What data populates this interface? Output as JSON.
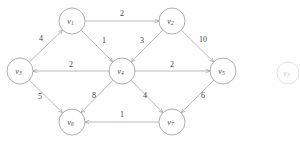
{
  "figure": {
    "type": "directed-weighted-graph",
    "node_radius": 13,
    "ghost_node": {
      "label": "v",
      "sub": "3",
      "cx": 288,
      "cy": 73,
      "r": 11
    }
  },
  "nodes": [
    {
      "id": "v1",
      "label": "v",
      "sub": "1",
      "cx": 72,
      "cy": 21
    },
    {
      "id": "v2",
      "label": "v",
      "sub": "2",
      "cx": 172,
      "cy": 21
    },
    {
      "id": "v3",
      "label": "v",
      "sub": "3",
      "cx": 20,
      "cy": 71
    },
    {
      "id": "v4",
      "label": "v",
      "sub": "4",
      "cx": 122,
      "cy": 71
    },
    {
      "id": "v5",
      "label": "v",
      "sub": "5",
      "cx": 223,
      "cy": 71
    },
    {
      "id": "v6",
      "label": "v",
      "sub": "6",
      "cx": 72,
      "cy": 122
    },
    {
      "id": "v7",
      "label": "v",
      "sub": "7",
      "cx": 172,
      "cy": 122
    }
  ],
  "edges": [
    {
      "from": "v1",
      "to": "v2",
      "weight": "2",
      "lx": 122,
      "ly": 13
    },
    {
      "from": "v3",
      "to": "v1",
      "weight": "4",
      "lx": 41,
      "ly": 38
    },
    {
      "from": "v1",
      "to": "v4",
      "weight": "1",
      "lx": 104,
      "ly": 40
    },
    {
      "from": "v2",
      "to": "v4",
      "weight": "3",
      "lx": 142,
      "ly": 40
    },
    {
      "from": "v2",
      "to": "v5",
      "weight": "10",
      "lx": 203,
      "ly": 39
    },
    {
      "from": "v4",
      "to": "v3",
      "weight": "2",
      "lx": 71,
      "ly": 64
    },
    {
      "from": "v4",
      "to": "v5",
      "weight": "2",
      "lx": 172,
      "ly": 64
    },
    {
      "from": "v3",
      "to": "v6",
      "weight": "5",
      "lx": 40,
      "ly": 96
    },
    {
      "from": "v4",
      "to": "v6",
      "weight": "8",
      "lx": 94,
      "ly": 95
    },
    {
      "from": "v4",
      "to": "v7",
      "weight": "4",
      "lx": 145,
      "ly": 95
    },
    {
      "from": "v5",
      "to": "v7",
      "weight": "6",
      "lx": 203,
      "ly": 95
    },
    {
      "from": "v7",
      "to": "v6",
      "weight": "1",
      "lx": 122,
      "ly": 114
    }
  ]
}
